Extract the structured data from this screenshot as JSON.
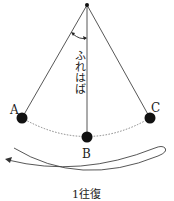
{
  "diagram": {
    "amplitude_label": "ふれはば",
    "points": {
      "A": "A",
      "B": "B",
      "C": "C"
    },
    "cycle_label": "1往復",
    "colors": {
      "line": "#444444",
      "bob": "#111111",
      "path": "#777777"
    }
  }
}
